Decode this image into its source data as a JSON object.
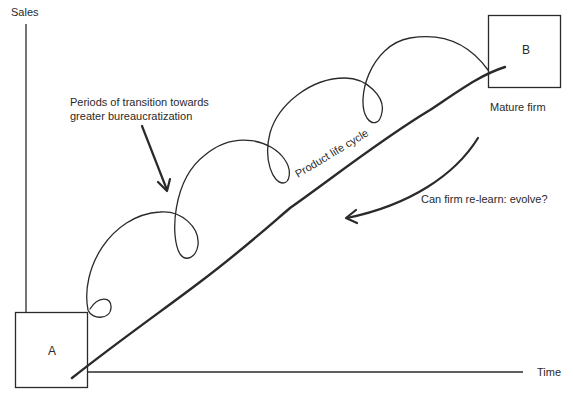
{
  "diagram": {
    "axes": {
      "y_label": "Sales",
      "x_label": "Time"
    },
    "boxes": {
      "start": {
        "label": "A"
      },
      "end": {
        "label": "B",
        "caption": "Mature firm"
      }
    },
    "annotations": {
      "transition_line1": "Periods of transition towards",
      "transition_line2": "greater bureaucratization",
      "curve_label": "Product life cycle",
      "question": "Can firm re-learn: evolve?"
    },
    "colors": {
      "stroke": "#2a2a2a",
      "background": "#ffffff"
    }
  }
}
